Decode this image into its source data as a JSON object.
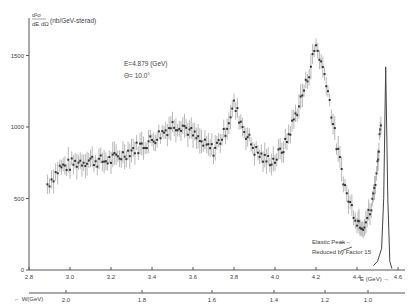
{
  "chart_data": {
    "type": "scatter",
    "title": "",
    "ylabel": "d²σ/dE dΩ (nb/GeV-sterad)",
    "xlabel": "E (GeV)",
    "secondary_xlabel": "W (GeV)",
    "annotation_energy": "E=4.879 (GeV)",
    "annotation_angle": "Θ= 10.0°",
    "annotation_elastic_1": "Elastic Peak",
    "annotation_elastic_2": "Reduced by Factor 15",
    "xlim": [
      2.8,
      4.6
    ],
    "ylim": [
      0,
      1600
    ],
    "x_ticks": [
      "2.8",
      "3.0",
      "3.2",
      "3.4",
      "3.6",
      "3.8",
      "4.0",
      "4.2",
      "4.4",
      "4.6"
    ],
    "y_ticks": [
      "0",
      "500",
      "1000",
      "1500"
    ],
    "w_ticks": [
      "2.0",
      "1.8",
      "1.6",
      "1.4",
      "1.2",
      "1.0"
    ],
    "grid": false,
    "legend": null,
    "series": [
      {
        "name": "Inelastic cross section (data with error bars)",
        "x": [
          2.89,
          2.95,
          3.0,
          3.05,
          3.1,
          3.15,
          3.2,
          3.25,
          3.3,
          3.35,
          3.4,
          3.45,
          3.5,
          3.55,
          3.6,
          3.65,
          3.7,
          3.75,
          3.8,
          3.85,
          3.9,
          3.95,
          4.0,
          4.05,
          4.1,
          4.15,
          4.2,
          4.25,
          4.3,
          4.35,
          4.4,
          4.43,
          4.47,
          4.5,
          4.52
        ],
        "y": [
          600,
          715,
          735,
          760,
          770,
          760,
          770,
          800,
          840,
          870,
          910,
          960,
          1015,
          1015,
          945,
          875,
          840,
          945,
          1155,
          980,
          840,
          770,
          770,
          875,
          1085,
          1295,
          1575,
          1330,
          875,
          525,
          350,
          315,
          420,
          735,
          1120
        ]
      },
      {
        "name": "Elastic Peak (reduced by factor 15)",
        "x": [
          4.48,
          4.5,
          4.52,
          4.53,
          4.54,
          4.55,
          4.56,
          4.57
        ],
        "y": [
          30,
          60,
          150,
          500,
          1420,
          500,
          60,
          10
        ]
      }
    ]
  }
}
